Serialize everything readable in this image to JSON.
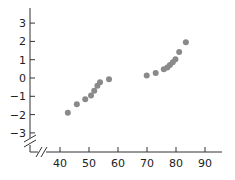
{
  "chart_data": {
    "type": "scatter",
    "title": "",
    "xlabel": "",
    "ylabel": "",
    "xlim": [
      40,
      90
    ],
    "ylim": [
      -3,
      3
    ],
    "x_ticks": [
      40,
      50,
      60,
      70,
      80,
      90
    ],
    "y_ticks": [
      3,
      2,
      1,
      0,
      -1,
      -2,
      -3
    ],
    "x_tick_labels": [
      "40",
      "50",
      "60",
      "70",
      "80",
      "90"
    ],
    "y_tick_labels": [
      "3",
      "2",
      "1",
      "0",
      "−1",
      "−2",
      "−3"
    ],
    "axis_breaks": {
      "x": true,
      "y": true
    },
    "grid": false,
    "legend": null,
    "series": [
      {
        "name": "points",
        "color": "#8a8a8a",
        "points": [
          {
            "x": 42.7,
            "y": -1.9
          },
          {
            "x": 45.8,
            "y": -1.44
          },
          {
            "x": 48.7,
            "y": -1.16
          },
          {
            "x": 50.7,
            "y": -0.95
          },
          {
            "x": 51.8,
            "y": -0.69
          },
          {
            "x": 52.9,
            "y": -0.42
          },
          {
            "x": 53.8,
            "y": -0.23
          },
          {
            "x": 56.9,
            "y": -0.07
          },
          {
            "x": 69.9,
            "y": 0.13
          },
          {
            "x": 73.0,
            "y": 0.27
          },
          {
            "x": 75.8,
            "y": 0.48
          },
          {
            "x": 77.0,
            "y": 0.58
          },
          {
            "x": 77.9,
            "y": 0.71
          },
          {
            "x": 78.9,
            "y": 0.86
          },
          {
            "x": 79.8,
            "y": 1.02
          },
          {
            "x": 81.1,
            "y": 1.42
          },
          {
            "x": 83.4,
            "y": 1.95
          }
        ]
      }
    ]
  },
  "layout": {
    "x_origin_px": 60,
    "x_px_per_unit": 2.9,
    "x_min_val": 40,
    "y_zero_px": 78,
    "y_px_per_unit": 18.3,
    "y_axis_x_px": 30,
    "x_axis_y_px": 152,
    "y_axis_top_px": 8,
    "x_axis_right_px": 222
  }
}
